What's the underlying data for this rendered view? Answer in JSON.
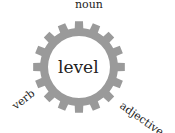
{
  "diagram": {
    "type": "gear-word-diagram",
    "center_word": "level",
    "labels": {
      "top": "noun",
      "bottom_left": "verb",
      "bottom_right": "adjective"
    },
    "gear": {
      "teeth": 16,
      "color": "#9a9a9a",
      "inner_fill": "#ffffff"
    }
  }
}
